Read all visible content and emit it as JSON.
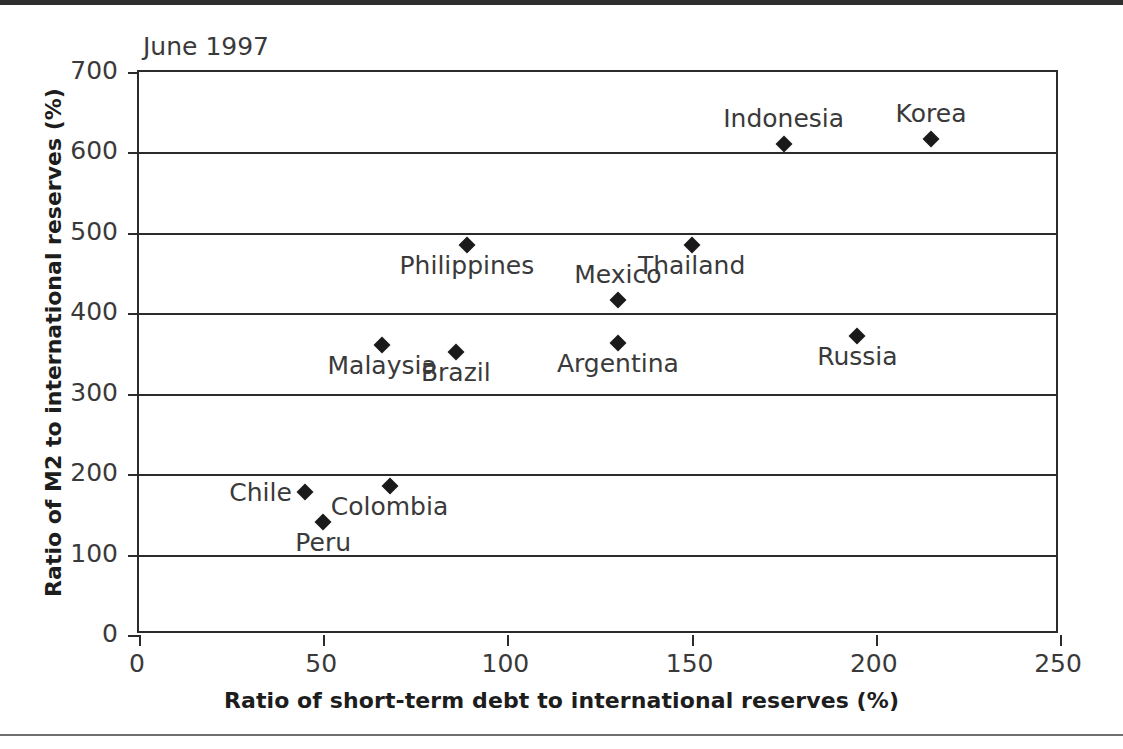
{
  "figure": {
    "annotation": "June 1997"
  },
  "chart_data": {
    "type": "scatter",
    "title": "June 1997",
    "xlabel": "Ratio of short-term debt to international reserves (%)",
    "ylabel": "Ratio of M2 to international reserves (%)",
    "xlim": [
      0,
      250
    ],
    "ylim": [
      0,
      700
    ],
    "xticks": [
      0,
      50,
      100,
      150,
      200,
      250
    ],
    "yticks": [
      0,
      100,
      200,
      300,
      400,
      500,
      600,
      700
    ],
    "grid": "horizontal",
    "legend": "none",
    "marker": "diamond",
    "marker_color": "#1a1a1a",
    "points": [
      {
        "label": "Chile",
        "x": 45,
        "y": 178,
        "label_pos": "left"
      },
      {
        "label": "Peru",
        "x": 50,
        "y": 140,
        "label_pos": "below"
      },
      {
        "label": "Colombia",
        "x": 68,
        "y": 185,
        "label_pos": "below"
      },
      {
        "label": "Malaysia",
        "x": 66,
        "y": 360,
        "label_pos": "below"
      },
      {
        "label": "Brazil",
        "x": 86,
        "y": 352,
        "label_pos": "below"
      },
      {
        "label": "Philippines",
        "x": 89,
        "y": 485,
        "label_pos": "below"
      },
      {
        "label": "Argentina",
        "x": 130,
        "y": 363,
        "label_pos": "below"
      },
      {
        "label": "Mexico",
        "x": 130,
        "y": 417,
        "label_pos": "above"
      },
      {
        "label": "Thailand",
        "x": 150,
        "y": 485,
        "label_pos": "below"
      },
      {
        "label": "Indonesia",
        "x": 175,
        "y": 610,
        "label_pos": "above"
      },
      {
        "label": "Russia",
        "x": 195,
        "y": 372,
        "label_pos": "below"
      },
      {
        "label": "Korea",
        "x": 215,
        "y": 617,
        "label_pos": "above"
      }
    ]
  }
}
